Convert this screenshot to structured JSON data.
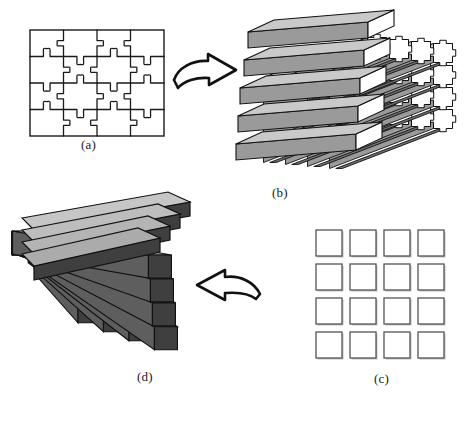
{
  "figure": {
    "background_color": "#ffffff",
    "panels": [
      {
        "id": "a",
        "caption": "(a)",
        "name": "jigsaw-puzzle-2d",
        "description": "Assembled flat jigsaw puzzle, 4 columns by 4 rows of interlocking pieces",
        "rows": 4,
        "cols": 4,
        "piece_count": 16,
        "stroke_color": "#1a1a1a",
        "fill_color": "#ffffff"
      },
      {
        "id": "b",
        "caption": "(b)",
        "name": "extruded-jigsaw-block-3d",
        "description": "Three-dimensional block formed by extruding the jigsaw pieces into long prisms, isometric view",
        "rows": 4,
        "cols": 4,
        "prism_count": 16,
        "top_face_color": "#c9c9c9",
        "front_face_color": "#9a9a9a",
        "side_face_color": "#ffffff",
        "shadow_color": "#6e6e6e",
        "stroke_color": "#111111"
      },
      {
        "id": "c",
        "caption": "(c)",
        "name": "separated-square-grid",
        "description": "Four by four grid of detached plain square tiles",
        "rows": 4,
        "cols": 4,
        "tile_count": 16,
        "stroke_color": "#555555",
        "fill_color": "#ffffff"
      },
      {
        "id": "d",
        "caption": "(d)",
        "name": "fanned-bar-array-3d",
        "description": "Fan-shaped array of dark extruded square bars radiating from a common vertex",
        "rows": 4,
        "cols": 4,
        "bar_count": 16,
        "top_face_color": "#b9b9b9",
        "front_face_color": "#3f3f3f",
        "side_face_color": "#5e5e5e",
        "stroke_color": "#111111"
      }
    ],
    "arrows": [
      {
        "id": "arrow-a-to-b",
        "name": "arrow-right-curved",
        "direction": "right",
        "from_panel": "a",
        "to_panel": "b",
        "stroke_color": "#111111",
        "fill_color": "#ffffff"
      },
      {
        "id": "arrow-c-to-d",
        "name": "arrow-left-curved",
        "direction": "left",
        "from_panel": "c",
        "to_panel": "d",
        "stroke_color": "#111111",
        "fill_color": "#ffffff"
      }
    ]
  }
}
